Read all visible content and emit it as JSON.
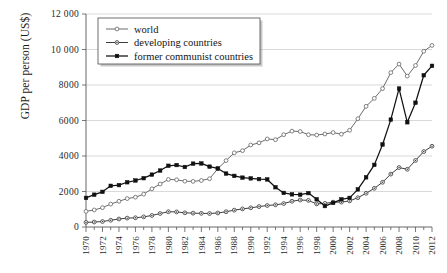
{
  "chart_data": {
    "type": "line",
    "title": "",
    "xlabel": "",
    "ylabel": "GDP per person (US$)",
    "xlim": [
      1970,
      2012
    ],
    "ylim": [
      0,
      12000
    ],
    "yticks": [
      0,
      2000,
      4000,
      6000,
      8000,
      10000,
      12000
    ],
    "ytick_labels": [
      "0",
      "2000",
      "4000",
      "6000",
      "8000",
      "10 000",
      "12 000"
    ],
    "xticks": [
      1970,
      1972,
      1974,
      1976,
      1978,
      1980,
      1982,
      1984,
      1986,
      1988,
      1990,
      1992,
      1994,
      1996,
      1998,
      2000,
      2002,
      2004,
      2006,
      2008,
      2010,
      2012
    ],
    "xtick_labels": [
      "1970",
      "1972",
      "1974",
      "1976",
      "1978",
      "1980",
      "1982",
      "1984",
      "1986",
      "1988",
      "1990",
      "1992",
      "1994",
      "1996",
      "1998",
      "2000",
      "2002",
      "2004",
      "2006",
      "2008",
      "2010",
      "2012"
    ],
    "minor_xticks_every": 1,
    "grid": "horizontal",
    "legend_position": "top-left",
    "x": [
      1970,
      1971,
      1972,
      1973,
      1974,
      1975,
      1976,
      1977,
      1978,
      1979,
      1980,
      1981,
      1982,
      1983,
      1984,
      1985,
      1986,
      1987,
      1988,
      1989,
      1990,
      1991,
      1992,
      1993,
      1994,
      1995,
      1996,
      1997,
      1998,
      1999,
      2000,
      2001,
      2002,
      2003,
      2004,
      2005,
      2006,
      2007,
      2008,
      2009,
      2010,
      2011,
      2012
    ],
    "series": [
      {
        "name": "world",
        "marker": "open-circle",
        "color": "#6b6b6b",
        "values": [
          880,
          960,
          1090,
          1290,
          1450,
          1600,
          1680,
          1850,
          2150,
          2420,
          2680,
          2660,
          2580,
          2570,
          2620,
          2720,
          3280,
          3740,
          4180,
          4300,
          4620,
          4740,
          4960,
          4920,
          5200,
          5400,
          5380,
          5200,
          5180,
          5240,
          5320,
          5230,
          5450,
          6100,
          6800,
          7250,
          7800,
          8700,
          9180,
          8500,
          9100,
          9900,
          10230
        ]
      },
      {
        "name": "developing countries",
        "marker": "dot-circle",
        "color": "#3d3d3d",
        "values": [
          260,
          280,
          310,
          380,
          450,
          500,
          520,
          570,
          650,
          760,
          860,
          850,
          800,
          780,
          770,
          760,
          790,
          860,
          950,
          1020,
          1080,
          1150,
          1210,
          1250,
          1320,
          1450,
          1520,
          1500,
          1300,
          1330,
          1400,
          1400,
          1470,
          1650,
          1900,
          2180,
          2520,
          2980,
          3350,
          3250,
          3750,
          4250,
          4550
        ]
      },
      {
        "name": "former communist countries",
        "marker": "filled-square",
        "color": "#111111",
        "values": [
          1640,
          1820,
          1980,
          2320,
          2360,
          2520,
          2620,
          2750,
          2950,
          3180,
          3450,
          3490,
          3380,
          3570,
          3580,
          3400,
          3300,
          3010,
          2880,
          2780,
          2740,
          2700,
          2680,
          2240,
          1920,
          1840,
          1820,
          1910,
          1560,
          1180,
          1360,
          1560,
          1640,
          2120,
          2800,
          3500,
          4650,
          6050,
          7800,
          5900,
          7000,
          8550,
          9080
        ]
      }
    ]
  },
  "legend": {
    "items": [
      {
        "label": "world"
      },
      {
        "label": "developing countries"
      },
      {
        "label": "former communist countries"
      }
    ]
  }
}
